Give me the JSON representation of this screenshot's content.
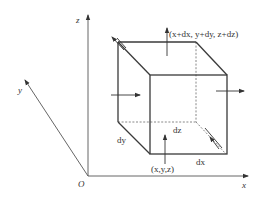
{
  "figure": {
    "type": "3d-control-volume",
    "axes": {
      "x_label": "x",
      "y_label": "y",
      "z_label": "z",
      "origin_label": "O"
    },
    "cube": {
      "corner_near_label": "(x,y,z)",
      "corner_far_label": "(x+dx, y+dy, z+dz)",
      "edge_labels": {
        "dx": "dx",
        "dy": "dy",
        "dz": "dz"
      }
    },
    "colors": {
      "line": "#3a3a3a",
      "text": "#333333",
      "background": "#ffffff"
    }
  }
}
